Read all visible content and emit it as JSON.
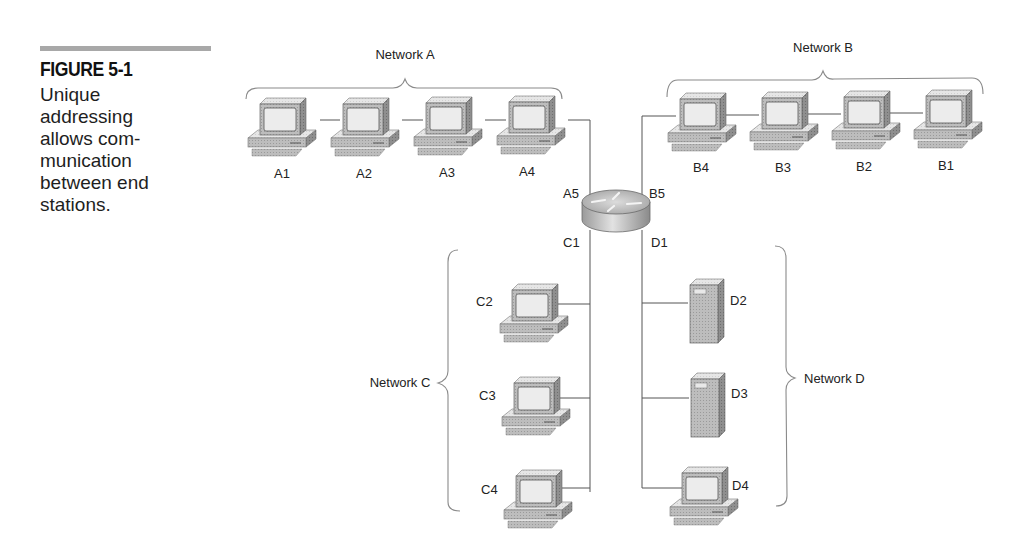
{
  "figure": {
    "number": "FIGURE 5-1",
    "caption_lines": [
      "Unique",
      "addressing",
      "allows com-",
      "munication",
      "between end",
      "stations."
    ],
    "caption": "Unique addressing allows communication between end stations."
  },
  "diagram": {
    "router": {
      "icon": "router-icon",
      "interfaces": {
        "top_left": "A5",
        "top_right": "B5",
        "bottom_left": "C1",
        "bottom_right": "D1"
      }
    },
    "networks": [
      {
        "id": "A",
        "label": "Network A",
        "hosts": [
          {
            "label": "A1",
            "type": "workstation"
          },
          {
            "label": "A2",
            "type": "workstation"
          },
          {
            "label": "A3",
            "type": "workstation"
          },
          {
            "label": "A4",
            "type": "workstation"
          }
        ],
        "router_interface": "A5"
      },
      {
        "id": "B",
        "label": "Network B",
        "hosts": [
          {
            "label": "B4",
            "type": "workstation"
          },
          {
            "label": "B3",
            "type": "workstation"
          },
          {
            "label": "B2",
            "type": "workstation"
          },
          {
            "label": "B1",
            "type": "workstation"
          }
        ],
        "router_interface": "B5"
      },
      {
        "id": "C",
        "label": "Network C",
        "hosts": [
          {
            "label": "C2",
            "type": "workstation"
          },
          {
            "label": "C3",
            "type": "workstation"
          },
          {
            "label": "C4",
            "type": "workstation"
          }
        ],
        "router_interface": "C1"
      },
      {
        "id": "D",
        "label": "Network D",
        "hosts": [
          {
            "label": "D2",
            "type": "server"
          },
          {
            "label": "D3",
            "type": "server"
          },
          {
            "label": "D4",
            "type": "workstation"
          }
        ],
        "router_interface": "D1"
      }
    ]
  }
}
